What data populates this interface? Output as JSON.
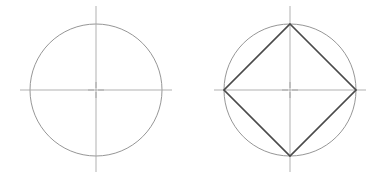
{
  "canvas": {
    "width": 384,
    "height": 177,
    "background": "#ffffff"
  },
  "styles": {
    "circle_stroke": "#8a8a8a",
    "circle_width": 0.9,
    "centerline_stroke": "#a8a8a8",
    "centerline_width": 0.9,
    "square_stroke": "#4a4a4a",
    "square_width": 1.7,
    "center_mark_stroke": "#a0a0a0",
    "center_mark_width": 0.9
  },
  "figures": [
    {
      "id": "figure-left",
      "name": "circle-with-centerlines",
      "title": "Circle with centerlines",
      "circle": {
        "cx": 96,
        "cy": 90,
        "r": 66
      },
      "centerlines": {
        "horizontal": {
          "x1": 20,
          "y1": 90,
          "x2": 172,
          "y2": 90
        },
        "vertical": {
          "x1": 96,
          "y1": 6,
          "x2": 96,
          "y2": 172
        }
      },
      "center_mark": {
        "cx": 96,
        "cy": 90,
        "arm": 6,
        "gap": 2
      },
      "inscribed_square": null
    },
    {
      "id": "figure-right",
      "name": "circle-with-inscribed-square",
      "title": "Circle with inscribed square",
      "circle": {
        "cx": 290,
        "cy": 90,
        "r": 66
      },
      "centerlines": {
        "horizontal": {
          "x1": 214,
          "y1": 90,
          "x2": 366,
          "y2": 90
        },
        "vertical": {
          "x1": 290,
          "y1": 6,
          "x2": 290,
          "y2": 172
        }
      },
      "center_mark": {
        "cx": 290,
        "cy": 90,
        "arm": 6,
        "gap": 2
      },
      "inscribed_square": {
        "points": "290,24 356,90 290,156 224,90",
        "vertices": [
          {
            "name": "top-vertex",
            "x": 290,
            "y": 24
          },
          {
            "name": "right-vertex",
            "x": 356,
            "y": 90
          },
          {
            "name": "bottom-vertex",
            "x": 290,
            "y": 156
          },
          {
            "name": "left-vertex",
            "x": 224,
            "y": 90
          }
        ]
      }
    }
  ]
}
